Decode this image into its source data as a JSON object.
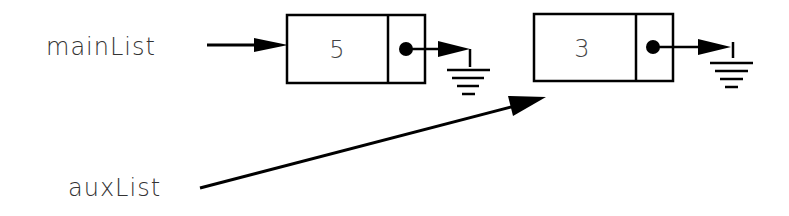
{
  "diagram": {
    "title": "",
    "pointers": [
      {
        "label": "mainList",
        "points_to": "node-1"
      },
      {
        "label": "auxList",
        "points_to": "node-2"
      }
    ],
    "nodes": [
      {
        "id": "node-1",
        "value": "5",
        "next": "null"
      },
      {
        "id": "node-2",
        "value": "3",
        "next": "null"
      }
    ]
  }
}
